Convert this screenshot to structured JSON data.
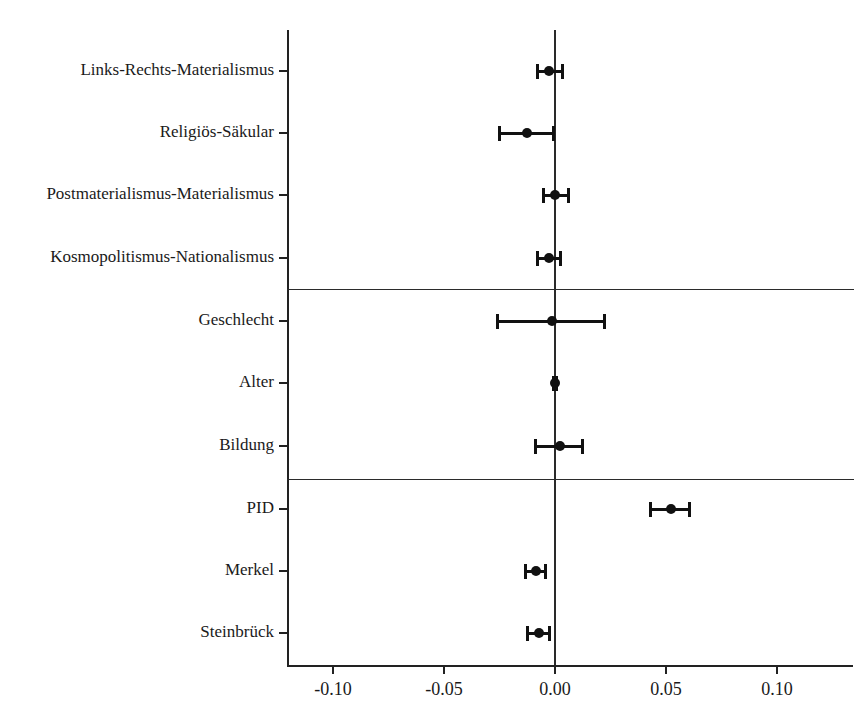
{
  "chart_data": {
    "type": "scatter",
    "subtype": "coefficient-plot",
    "title": "",
    "xlabel": "",
    "ylabel": "",
    "xlim": [
      -0.125,
      0.1345
    ],
    "grid": false,
    "legend": null,
    "zero_reference_line": 0.0,
    "x_ticks": [
      -0.1,
      -0.05,
      0.0,
      0.05,
      0.1
    ],
    "x_tick_labels": [
      "-0.10",
      "-0.05",
      "0.00",
      "0.05",
      "0.10"
    ],
    "categories": [
      "Links-Rechts-Materialismus",
      "Religiös-Säkular",
      "Postmaterialismus-Materialismus",
      "Kosmopolitismus-Nationalismus",
      "Geschlecht",
      "Alter",
      "Bildung",
      "PID",
      "Merkel",
      "Steinbrück"
    ],
    "estimates": [
      -0.0027,
      -0.0126,
      0.0,
      -0.0027,
      -0.0014,
      -0.0002,
      0.0023,
      0.0523,
      -0.0086,
      -0.0072
    ],
    "ci_lower": [
      -0.0077,
      -0.0248,
      -0.0054,
      -0.0081,
      -0.0257,
      -0.0007,
      -0.009,
      0.0428,
      -0.0131,
      -0.0122
    ],
    "ci_upper": [
      0.0036,
      -0.0009,
      0.0059,
      0.0023,
      0.0221,
      0.0005,
      0.0126,
      0.0604,
      -0.0041,
      -0.0023
    ],
    "group_separators_after": [
      4,
      7
    ],
    "groups": [
      {
        "name": "",
        "categories": [
          "Links-Rechts-Materialismus",
          "Religiös-Säkular",
          "Postmaterialismus-Materialismus",
          "Kosmopolitismus-Nationalismus"
        ]
      },
      {
        "name": "",
        "categories": [
          "Geschlecht",
          "Alter",
          "Bildung"
        ]
      },
      {
        "name": "",
        "categories": [
          "PID",
          "Merkel",
          "Steinbrück"
        ]
      }
    ],
    "marker_color": "#111111",
    "axis_color": "#222222"
  },
  "axis": {
    "x_tick_labels": [
      "-0.10",
      "-0.05",
      "0.00",
      "0.05",
      "0.10"
    ]
  },
  "y_labels": [
    "Links-Rechts-Materialismus",
    "Religiös-Säkular",
    "Postmaterialismus-Materialismus",
    "Kosmopolitismus-Nationalismus",
    "Geschlecht",
    "Alter",
    "Bildung",
    "PID",
    "Merkel",
    "Steinbrück"
  ]
}
